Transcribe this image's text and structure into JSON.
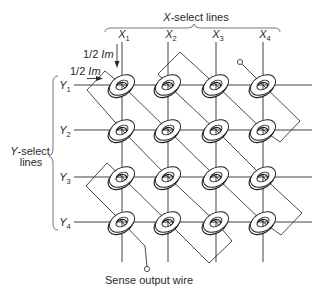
{
  "figure": {
    "x_select": {
      "italic": "X",
      "text": "-select lines"
    },
    "y_select": {
      "italic": "Y",
      "text": "-select",
      "line2": "lines"
    },
    "x_lines": [
      {
        "name": "X",
        "sub": "1"
      },
      {
        "name": "X",
        "sub": "2"
      },
      {
        "name": "X",
        "sub": "3"
      },
      {
        "name": "X",
        "sub": "4"
      }
    ],
    "y_lines": [
      {
        "name": "Y",
        "sub": "1"
      },
      {
        "name": "Y",
        "sub": "2"
      },
      {
        "name": "Y",
        "sub": "3"
      },
      {
        "name": "Y",
        "sub": "4"
      }
    ],
    "drive_currents": [
      {
        "fraction": "1/2",
        "symbol": "Im",
        "direction": "down",
        "applied_to": "X1"
      },
      {
        "fraction": "1/2",
        "symbol": "Im",
        "direction": "right",
        "applied_to": "Y1"
      }
    ],
    "cores": {
      "rows": 4,
      "columns": 4
    },
    "sense_wire": {
      "label": "Sense output wire",
      "route": [
        "X4Y1",
        "X4Y2",
        "X3Y1",
        "X2Y1",
        "X3Y2",
        "X4Y3",
        "X4Y4",
        "X3Y3",
        "X2Y2",
        "X1Y1",
        "X1Y2",
        "X2Y3",
        "X3Y4",
        "X2Y4",
        "X1Y3",
        "X1Y4"
      ]
    },
    "colors": {
      "ink": "#2a2a2a",
      "background": "#ffffff"
    }
  }
}
